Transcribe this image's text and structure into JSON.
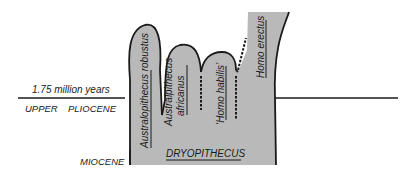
{
  "diagram": {
    "type": "phylogenetic-tree",
    "colors": {
      "fill": "#b9b9b9",
      "outline": "#1a1a1a",
      "background": "#ffffff"
    },
    "time_marker": {
      "label": "1.75 million years"
    },
    "epochs": {
      "upper": "UPPER",
      "pliocene": "PLIOCENE",
      "miocene": "MIOCENE"
    },
    "ancestor": {
      "label": "DRYOPITHECUS"
    },
    "branches": [
      {
        "label": "Australopithecus robustus"
      },
      {
        "label_line1": "Australpithecus",
        "label_line2": "africanus"
      },
      {
        "label": "‘Homo habilis’"
      },
      {
        "label": "Homo erectus"
      }
    ]
  }
}
